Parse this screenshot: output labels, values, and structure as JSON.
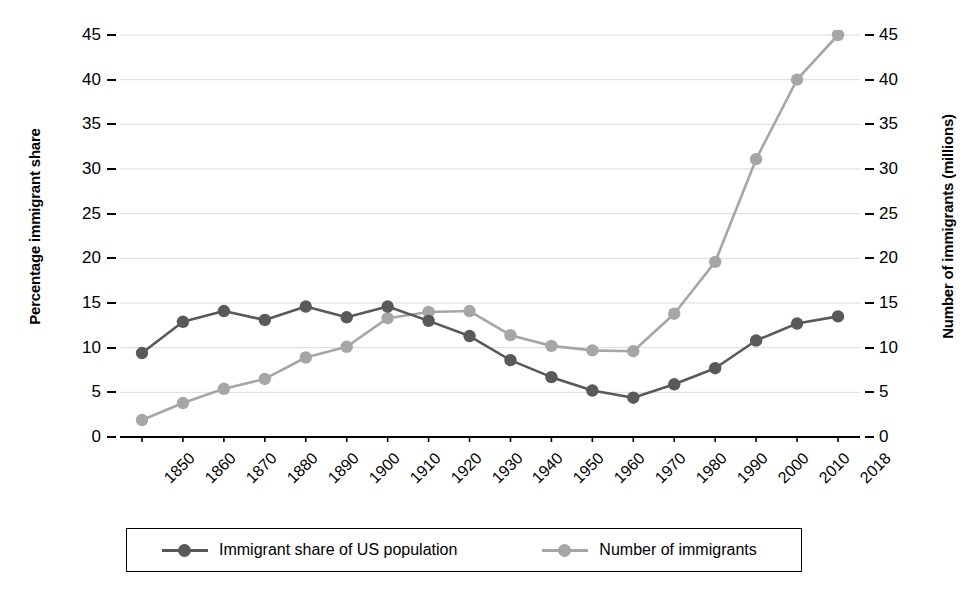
{
  "chart_data": {
    "type": "line",
    "title": "",
    "xlabel": "",
    "ylabel": "Percentage immigrant share",
    "y2label": "Number of immigrants (millions)",
    "categories": [
      "1850",
      "1860",
      "1870",
      "1880",
      "1890",
      "1900",
      "1910",
      "1920",
      "1930",
      "1940",
      "1950",
      "1960",
      "1970",
      "1980",
      "1990",
      "2000",
      "2010",
      "2018"
    ],
    "ylim": [
      0,
      45
    ],
    "y2lim": [
      0,
      45
    ],
    "yticks": [
      "45",
      "40",
      "35",
      "30",
      "25",
      "20",
      "15",
      "10",
      "5",
      "0"
    ],
    "y2ticks": [
      "45",
      "40",
      "35",
      "30",
      "25",
      "20",
      "15",
      "10",
      "5",
      "0"
    ],
    "ytick_values": [
      45,
      40,
      35,
      30,
      25,
      20,
      15,
      10,
      5,
      0
    ],
    "grid": true,
    "legend_position": "bottom",
    "series": [
      {
        "name": "Immigrant share of US population",
        "axis": "left",
        "color": "#595959",
        "marker": "circle",
        "values": [
          9.4,
          12.9,
          14.1,
          13.1,
          14.6,
          13.4,
          14.6,
          13.0,
          11.3,
          8.6,
          6.7,
          5.2,
          4.4,
          5.9,
          7.7,
          10.8,
          12.7,
          13.5
        ]
      },
      {
        "name": "Number of immigrants",
        "axis": "right",
        "color": "#a6a6a6",
        "marker": "circle",
        "values": [
          1.9,
          3.8,
          5.4,
          6.5,
          8.9,
          10.1,
          13.3,
          14.0,
          14.1,
          11.4,
          10.2,
          9.7,
          9.6,
          13.8,
          19.6,
          31.1,
          40.0,
          45.0
        ]
      }
    ]
  },
  "legend": {
    "items": [
      {
        "label": "Immigrant share of US population",
        "color": "#595959"
      },
      {
        "label": "Number of immigrants",
        "color": "#a6a6a6"
      }
    ]
  },
  "axes": {
    "left_title": "Percentage immigrant share",
    "right_title": "Number of immigrants (millions)"
  },
  "colors": {
    "series_dark": "#595959",
    "series_light": "#a6a6a6",
    "axis": "#000000",
    "grid": "#d9d9d9",
    "background": "#ffffff"
  }
}
